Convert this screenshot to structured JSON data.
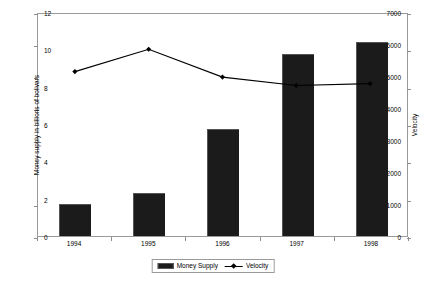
{
  "chart_data": {
    "type": "bar",
    "title": "",
    "categories": [
      "1994",
      "1995",
      "1996",
      "1997",
      "1998"
    ],
    "series": [
      {
        "name": "Money Supply",
        "type": "bar",
        "axis": "left",
        "values": [
          1000,
          1350,
          3350,
          5700,
          6050
        ],
        "color": "#1b1b1b"
      },
      {
        "name": "Velocity",
        "type": "line",
        "axis": "right",
        "values": [
          8.9,
          10.1,
          8.6,
          8.15,
          8.25
        ],
        "color": "#000000",
        "marker": "diamond"
      }
    ],
    "xlabel": "",
    "ylabel": "Money supply in billions of bolivars",
    "y2label": "Velocity",
    "ylim": [
      0,
      7000
    ],
    "y2lim": [
      0,
      12
    ],
    "yticks": [
      0,
      1000,
      2000,
      3000,
      4000,
      5000,
      6000,
      7000
    ],
    "y2ticks": [
      0,
      2,
      4,
      6,
      8,
      10,
      12
    ],
    "ytick_labels": [
      "0",
      "1000",
      "2000",
      "3000",
      "4000",
      "5000",
      "6000",
      "7000"
    ],
    "y2tick_labels": [
      "0",
      "2",
      "4",
      "6",
      "8",
      "10",
      "12"
    ],
    "grid": false,
    "legend_position": "bottom",
    "legend_entries": [
      {
        "label": "Money Supply",
        "swatch": "bar"
      },
      {
        "label": "Velocity",
        "swatch": "line-diamond"
      }
    ]
  }
}
